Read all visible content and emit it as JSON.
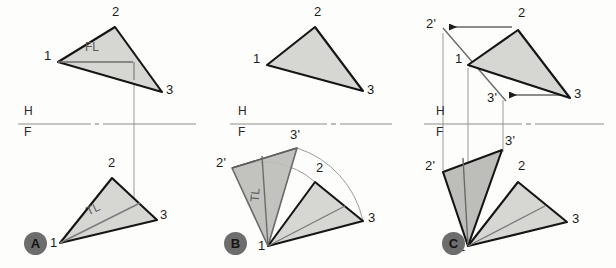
{
  "figure": {
    "panels": [
      {
        "id": "A",
        "badge": "A",
        "badge_pos": [
          24,
          232
        ],
        "reference_line": {
          "h_label": "H",
          "f_label": "F",
          "y": 124,
          "x1": 18,
          "x2": 196,
          "h_pos": [
            26,
            109
          ],
          "f_pos": [
            26,
            127
          ]
        },
        "top_view": {
          "vertices": {
            "1": [
              58,
              62
            ],
            "2": [
              115,
              27
            ],
            "3": [
              162,
              92
            ]
          },
          "labels": [
            {
              "text": "1",
              "pos": [
                44,
                55
              ]
            },
            {
              "text": "2",
              "pos": [
                114,
                10
              ]
            },
            {
              "text": "3",
              "pos": [
                166,
                89
              ]
            }
          ],
          "inner_line": {
            "from": [
              58,
              62
            ],
            "to": [
              133,
              62
            ]
          },
          "inner_label": {
            "text": "FL",
            "pos": [
              88,
              44
            ]
          }
        },
        "front_view": {
          "vertices": {
            "1": [
              60,
              243
            ],
            "2": [
              112,
              178
            ],
            "3": [
              157,
              220
            ]
          },
          "labels": [
            {
              "text": "1",
              "pos": [
                52,
                240
              ]
            },
            {
              "text": "2",
              "pos": [
                110,
                160
              ]
            },
            {
              "text": "3",
              "pos": [
                161,
                213
              ]
            },
            {
              "text": "TL",
              "pos": [
                90,
                205
              ]
            }
          ],
          "inner_line": {
            "from": [
              60,
              243
            ],
            "to": [
              140,
              203
            ]
          }
        },
        "projector": {
          "x": 134,
          "y1": 62,
          "y2": 221
        }
      },
      {
        "id": "B",
        "badge": "B",
        "badge_pos": [
          224,
          232
        ],
        "reference_line": {
          "h_label": "H",
          "f_label": "F",
          "y": 124,
          "x1": 230,
          "x2": 392,
          "h_pos": [
            240,
            109
          ],
          "f_pos": [
            240,
            127
          ]
        },
        "top_view": {
          "vertices": {
            "1": [
              267,
              65
            ],
            "2": [
              315,
              27
            ],
            "3": [
              363,
              91
            ]
          },
          "labels": [
            {
              "text": "1",
              "pos": [
                254,
                58
              ]
            },
            {
              "text": "2",
              "pos": [
                316,
                10
              ]
            },
            {
              "text": "3",
              "pos": [
                367,
                89
              ]
            }
          ]
        },
        "front_view": {
          "vertices": {
            "1": [
              268,
              246
            ],
            "2": [
              315,
              182
            ],
            "3": [
              363,
              221
            ]
          },
          "rotated": {
            "2p": [
              232,
              168
            ],
            "3p": [
              297,
              148
            ]
          },
          "labels": [
            {
              "text": "1",
              "pos": [
                260,
                243
              ]
            },
            {
              "text": "2",
              "pos": [
                318,
                166
              ]
            },
            {
              "text": "3",
              "pos": [
                368,
                216
              ]
            },
            {
              "text": "2'",
              "pos": [
                219,
                160
              ]
            },
            {
              "text": "3'",
              "pos": [
                292,
                132
              ]
            },
            {
              "text": "TL",
              "pos": [
                252,
                193
              ]
            }
          ],
          "arc_2": {
            "from": [
              315,
              182
            ],
            "to": [
              232,
              168
            ],
            "center": [
              268,
              246
            ]
          },
          "arc_3": {
            "from": [
              363,
              221
            ],
            "to": [
              297,
              148
            ],
            "center": [
              268,
              246
            ]
          },
          "inner_line": {
            "from": [
              268,
              246
            ],
            "to": [
              345,
              206
            ]
          }
        }
      },
      {
        "id": "C",
        "badge": "C",
        "badge_pos": [
          442,
          232
        ],
        "reference_line": {
          "h_label": "H",
          "f_label": "F",
          "y": 124,
          "x1": 424,
          "x2": 604,
          "h_pos": [
            438,
            109
          ],
          "f_pos": [
            438,
            127
          ]
        },
        "top_view": {
          "vertices": {
            "1": [
              468,
              65
            ],
            "2": [
              518,
              30
            ],
            "3": [
              570,
              98
            ]
          },
          "rotated": {
            "2p": [
              443,
              28
            ],
            "3p": [
              503,
              97
            ]
          },
          "labels": [
            {
              "text": "1",
              "pos": [
                456,
                58
              ]
            },
            {
              "text": "2",
              "pos": [
                520,
                11
              ]
            },
            {
              "text": "3",
              "pos": [
                575,
                92
              ]
            },
            {
              "text": "2'",
              "pos": [
                428,
                21
              ]
            },
            {
              "text": "3'",
              "pos": [
                489,
                96
              ]
            }
          ],
          "arrow_2": {
            "from": [
              512,
              27
            ],
            "to": [
              449,
              27
            ]
          },
          "arrow_3": {
            "from": [
              564,
              95
            ],
            "to": [
              509,
              95
            ]
          },
          "axis_line": {
            "from": [
              443,
              28
            ],
            "to": [
              506,
              101
            ]
          }
        },
        "front_view": {
          "vertices": {
            "1": [
              468,
              246
            ],
            "2": [
              518,
              182
            ],
            "3": [
              567,
              222
            ]
          },
          "rotated": {
            "2p": [
              443,
              172
            ],
            "3p": [
              502,
              150
            ]
          },
          "labels": [
            {
              "text": "1",
              "pos": [
                460,
                244
              ]
            },
            {
              "text": "2",
              "pos": [
                520,
                164
              ]
            },
            {
              "text": "3",
              "pos": [
                572,
                217
              ]
            },
            {
              "text": "2'",
              "pos": [
                428,
                164
              ]
            },
            {
              "text": "3'",
              "pos": [
                506,
                138
              ]
            }
          ],
          "inner_line": {
            "from": [
              468,
              246
            ],
            "to": [
              545,
              206
            ]
          }
        },
        "projectors": [
          {
            "x": 443,
            "y1": 33,
            "y2": 170
          },
          {
            "x": 468,
            "y1": 68,
            "y2": 244
          },
          {
            "x": 503,
            "y1": 100,
            "y2": 152
          }
        ]
      }
    ],
    "colors": {
      "fill_light": "#d6d6d3",
      "fill_dark": "#b6b6b2",
      "outline": "#151515",
      "thin_line": "#8d8d8d",
      "badge": "#6d6d6d",
      "paper": "#fdfdfb"
    }
  }
}
